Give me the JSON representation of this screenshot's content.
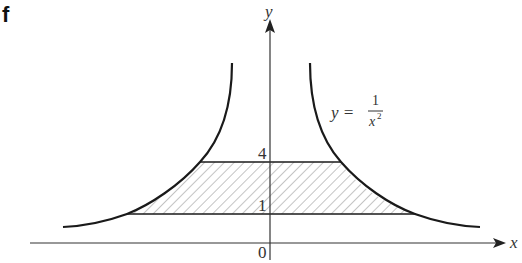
{
  "panel_label": "f",
  "axes": {
    "x_label": "x",
    "y_label": "y",
    "origin_label": "0",
    "y_ticks": [
      {
        "label": "4",
        "value": 4
      },
      {
        "label": "1",
        "value": 1
      }
    ]
  },
  "curve": {
    "equation_lhs": "y =",
    "equation_num": "1",
    "equation_den": "x",
    "equation_exp": "2",
    "description": "y = 1/x^2"
  },
  "shaded_region": {
    "description": "Region between y = 1 and y = 4 bounded by the curve y = 1/x^2 on both sides",
    "y_lower": 1,
    "y_upper": 4,
    "pattern": "diagonal hatching"
  },
  "colors": {
    "stroke": "#1a1a1a",
    "hatch": "#888888",
    "text": "#333333"
  }
}
